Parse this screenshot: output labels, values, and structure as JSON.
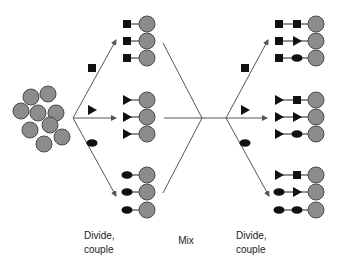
{
  "colors": {
    "bead_fill": "#8c8c8c",
    "bead_stroke": "#4a4a4a",
    "line": "#555555",
    "symbol": "#111111",
    "text": "#222222"
  },
  "bead_pool": {
    "beads": [
      [
        31,
        97
      ],
      [
        48,
        94
      ],
      [
        21,
        111
      ],
      [
        38,
        113
      ],
      [
        56,
        113
      ],
      [
        50,
        125
      ],
      [
        30,
        130
      ],
      [
        62,
        137
      ],
      [
        44,
        144
      ]
    ],
    "radius": 8
  },
  "stages": [
    {
      "label_line1": "Divide,",
      "label_line2": "couple"
    },
    {
      "label": "Mix"
    },
    {
      "label_line1": "Divide,",
      "label_line2": "couple"
    }
  ],
  "fan1": {
    "origin": [
      73,
      118
    ],
    "targets": [
      [
        116,
        40
      ],
      [
        116,
        118
      ],
      [
        116,
        196
      ]
    ],
    "monomers": [
      {
        "shape": "square",
        "pos": [
          92,
          68
        ]
      },
      {
        "shape": "triangle",
        "pos": [
          92,
          110
        ]
      },
      {
        "shape": "oval",
        "pos": [
          92,
          143
        ]
      }
    ]
  },
  "split1_products": {
    "symbol_x": 127,
    "bead_x": 147,
    "rows": [
      {
        "y": 24,
        "chain": [
          "square"
        ]
      },
      {
        "y": 41,
        "chain": [
          "square"
        ]
      },
      {
        "y": 58,
        "chain": [
          "square"
        ]
      },
      {
        "y": 100,
        "chain": [
          "triangle"
        ]
      },
      {
        "y": 117,
        "chain": [
          "triangle"
        ]
      },
      {
        "y": 134,
        "chain": [
          "triangle"
        ]
      },
      {
        "y": 175,
        "chain": [
          "oval"
        ]
      },
      {
        "y": 192,
        "chain": [
          "oval"
        ]
      },
      {
        "y": 210,
        "chain": [
          "oval"
        ]
      }
    ]
  },
  "mix_lines": [
    [
      [
        163,
        43
      ],
      [
        202,
        118
      ]
    ],
    [
      [
        163,
        193
      ],
      [
        202,
        118
      ]
    ],
    [
      [
        164,
        118
      ],
      [
        202,
        118
      ]
    ],
    [
      [
        202,
        118
      ],
      [
        226,
        118
      ]
    ]
  ],
  "fan2": {
    "origin": [
      226,
      118
    ],
    "targets": [
      [
        268,
        40
      ],
      [
        267,
        118
      ],
      [
        269,
        196
      ]
    ],
    "monomers": [
      {
        "shape": "square",
        "pos": [
          245,
          68
        ]
      },
      {
        "shape": "triangle",
        "pos": [
          245,
          110
        ]
      },
      {
        "shape": "oval",
        "pos": [
          245,
          143
        ]
      }
    ]
  },
  "split2_products": {
    "symbol_x": [
      279,
      297
    ],
    "bead_x": 316,
    "rows": [
      {
        "y": 24,
        "chain": [
          "square",
          "square"
        ]
      },
      {
        "y": 41,
        "chain": [
          "square",
          "triangle"
        ]
      },
      {
        "y": 58,
        "chain": [
          "square",
          "oval"
        ]
      },
      {
        "y": 100,
        "chain": [
          "triangle",
          "square"
        ]
      },
      {
        "y": 117,
        "chain": [
          "triangle",
          "triangle"
        ]
      },
      {
        "y": 134,
        "chain": [
          "triangle",
          "oval"
        ]
      },
      {
        "y": 175,
        "chain": [
          "triangle",
          "square"
        ]
      },
      {
        "y": 192,
        "chain": [
          "oval",
          "triangle"
        ]
      },
      {
        "y": 210,
        "chain": [
          "oval",
          "oval"
        ]
      }
    ]
  }
}
